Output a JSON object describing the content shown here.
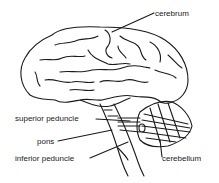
{
  "diagram": {
    "colors": {
      "ink": "#1a1a1a",
      "background": "#ffffff"
    },
    "labels": [
      {
        "id": "cerebrum",
        "text": "cerebrum",
        "x": 155,
        "y": 10
      },
      {
        "id": "superior-peduncle",
        "text": "superior peduncle",
        "x": 15,
        "y": 115
      },
      {
        "id": "pons",
        "text": "pons",
        "x": 37,
        "y": 138
      },
      {
        "id": "inferior-peduncle",
        "text": "inferior peduncle",
        "x": 15,
        "y": 155
      },
      {
        "id": "cerebellum",
        "text": "cerebellum",
        "x": 162,
        "y": 155
      }
    ]
  }
}
